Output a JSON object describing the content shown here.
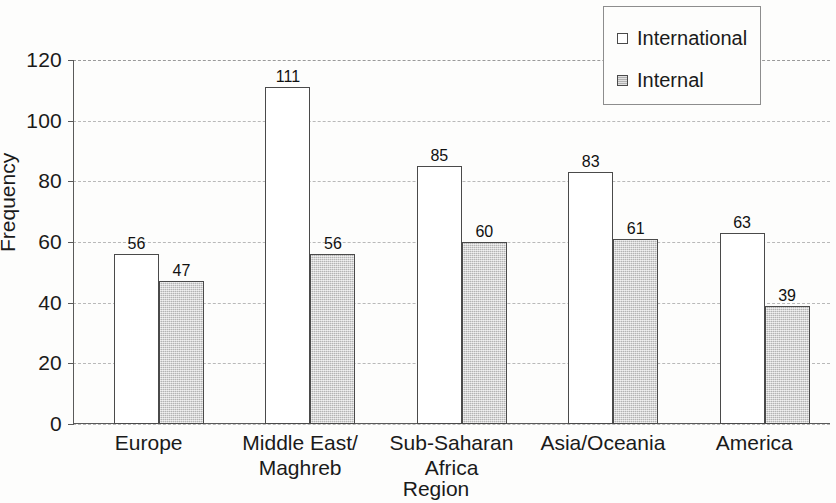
{
  "chart_data": {
    "type": "bar",
    "title": "",
    "xlabel": "Region",
    "ylabel": "Frequency",
    "categories": [
      "Europe",
      "Middle East/\nMaghreb",
      "Sub-Saharan\nAfrica",
      "Asia/Oceania",
      "America"
    ],
    "series": [
      {
        "name": "International",
        "values": [
          56,
          111,
          85,
          83,
          63
        ]
      },
      {
        "name": "Internal",
        "values": [
          47,
          56,
          60,
          61,
          39
        ]
      }
    ],
    "ylim": [
      0,
      120
    ],
    "yticks": [
      0,
      20,
      40,
      60,
      80,
      100,
      120
    ],
    "grid": true,
    "legend_position": "top-right",
    "colors": {
      "international": "#ffffff",
      "internal": "#c9c9c9",
      "outline": "#4a4a4a",
      "gridline": "#b9b9b9",
      "axis": "#5a5a5a",
      "text": "#1a1a1a",
      "background": "#fdfdfc"
    }
  },
  "legend": {
    "entries": [
      {
        "label": "International",
        "swatch": "swatch-hollow-square"
      },
      {
        "label": "Internal",
        "swatch": "swatch-filled-square"
      }
    ]
  },
  "axes": {
    "y_tick_labels": [
      "120",
      "100",
      "80",
      "60",
      "40",
      "20",
      "0"
    ],
    "y_title": "Frequency",
    "x_title": "Region"
  },
  "categories_display": [
    {
      "line1": "Europe",
      "line2": ""
    },
    {
      "line1": "Middle East/",
      "line2": "Maghreb"
    },
    {
      "line1": "Sub-Saharan",
      "line2": "Africa"
    },
    {
      "line1": "Asia/Oceania",
      "line2": ""
    },
    {
      "line1": "America",
      "line2": ""
    }
  ],
  "bar_labels": {
    "europe_intl": "56",
    "europe_internal": "47",
    "me_intl": "111",
    "me_internal": "56",
    "ssa_intl": "85",
    "ssa_internal": "60",
    "asia_intl": "83",
    "asia_internal": "61",
    "america_intl": "63",
    "america_internal": "39"
  }
}
